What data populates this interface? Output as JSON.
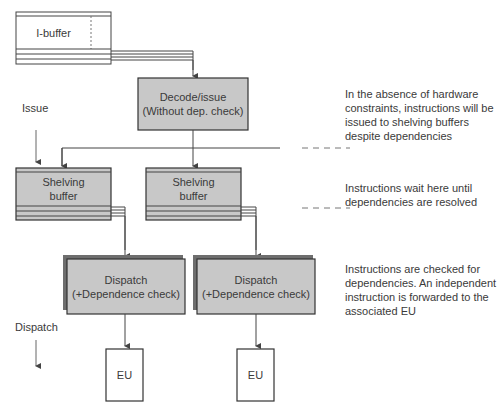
{
  "diagram": {
    "nodes": {
      "ibuffer": {
        "label": "I-buffer"
      },
      "decode": {
        "line1": "Decode/issue",
        "line2": "(Without dep. check)"
      },
      "shelving_left": {
        "line1": "Shelving",
        "line2": "buffer"
      },
      "shelving_right": {
        "line1": "Shelving",
        "line2": "buffer"
      },
      "dispatch_left": {
        "line1": "Dispatch",
        "line2": "(+Dependence check)"
      },
      "dispatch_right": {
        "line1": "Dispatch",
        "line2": "(+Dependence check)"
      },
      "eu_left": {
        "label": "EU"
      },
      "eu_right": {
        "label": "EU"
      }
    },
    "stage_labels": {
      "issue": "Issue",
      "dispatch": "Dispatch"
    },
    "annotations": {
      "issue_note": "In the absence of hardware constraints, instructions will be issued to shelving buffers despite dependencies",
      "shelving_note": "Instructions wait here until dependencies are resolved",
      "dispatch_note": "Instructions are checked for dependencies. An independent instruction is forwarded to the associated EU"
    },
    "colors": {
      "box_fill": "#c8c8c8",
      "box_border": "#3c3c3c",
      "shadow": "#6e6e6e",
      "line": "#444444",
      "text": "#3a3a3a"
    }
  }
}
